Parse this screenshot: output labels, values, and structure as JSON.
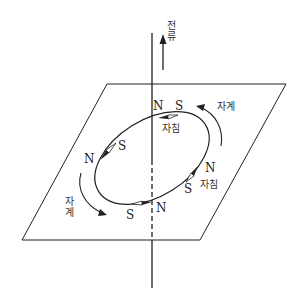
{
  "diagram": {
    "current_label": "전류",
    "field_label_top": "자계",
    "field_label_left": "자계",
    "needle_label_top": "자침",
    "needle_label_right": "자침",
    "poles": {
      "top_n": "N",
      "top_s": "S",
      "left_n": "N",
      "left_s": "S",
      "bottom_n": "N",
      "bottom_s": "S",
      "right_n": "N",
      "right_s": "S"
    },
    "colors": {
      "line": "#222222",
      "background": "#ffffff"
    }
  }
}
